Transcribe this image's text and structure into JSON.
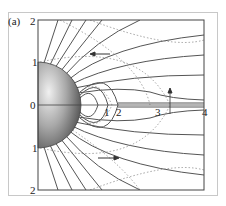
{
  "figure": {
    "panel_label": "(a)",
    "y_ticks": [
      "2",
      "1",
      "0",
      "1",
      "2"
    ],
    "x_ticks": [
      "1",
      "2",
      "3",
      "4"
    ],
    "colors": {
      "field_line": "#555555",
      "dotted_line": "#8a8a8a",
      "frame": "#444444",
      "outer_frame": "#c8c8c8",
      "sphere_light": "#e6e6e6",
      "sphere_dark": "#4a4a4a"
    },
    "annotations": [
      {
        "type": "arrow",
        "direction": "left",
        "position": "upper"
      },
      {
        "type": "arrow",
        "direction": "right",
        "position": "lower"
      },
      {
        "type": "arrow",
        "direction": "up",
        "position": "near x=3"
      }
    ]
  }
}
